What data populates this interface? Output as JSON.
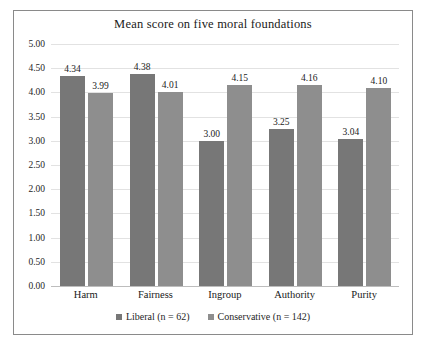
{
  "chart_data": {
    "type": "bar",
    "title": "Mean score on five moral foundations",
    "xlabel": "",
    "ylabel": "",
    "ylim": [
      0,
      5
    ],
    "ytick_step": 0.5,
    "grid": true,
    "legend_position": "bottom",
    "categories": [
      "Harm",
      "Fairness",
      "Ingroup",
      "Authority",
      "Purity"
    ],
    "ytick_labels": [
      "0.00",
      "0.50",
      "1.00",
      "1.50",
      "2.00",
      "2.50",
      "3.00",
      "3.50",
      "4.00",
      "4.50",
      "5.00"
    ],
    "series": [
      {
        "name": "Liberal (n = 62)",
        "color": "#777777",
        "values": [
          4.34,
          4.38,
          3.0,
          3.25,
          3.04
        ],
        "labels": [
          "4.34",
          "4.38",
          "3.00",
          "3.25",
          "3.04"
        ]
      },
      {
        "name": "Conservative (n = 142)",
        "color": "#8e8e8e",
        "values": [
          3.99,
          4.01,
          4.15,
          4.16,
          4.1
        ],
        "labels": [
          "3.99",
          "4.01",
          "4.15",
          "4.16",
          "4.10"
        ]
      }
    ]
  }
}
